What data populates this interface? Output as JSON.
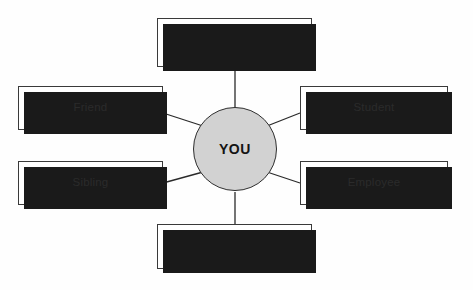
{
  "diagram": {
    "type": "radial-concept-map",
    "center": {
      "label": "YOU",
      "shape": "circle",
      "fill_color": "#d2d2d2",
      "border_color": "#2e2e2e",
      "cx": 235,
      "cy": 149,
      "r": 42
    },
    "style": {
      "background_color": "#fefefe",
      "box_fill_color": "#ffffff",
      "box_border_color": "#3a3a3a",
      "shadow_color": "#1a1a1a",
      "connector_color": "#2a2a2a",
      "text_color": "#2b2b2b"
    },
    "nodes": [
      {
        "id": "node-top",
        "label": "",
        "position": "top",
        "x": 157,
        "y": 18,
        "width": 155,
        "height": 49,
        "connector": {
          "x1": 235,
          "y1": 67,
          "x2": 235,
          "y2": 107
        }
      },
      {
        "id": "node-friend",
        "label": "Friend",
        "position": "left-upper",
        "x": 18,
        "y": 86,
        "width": 145,
        "height": 44,
        "connector": {
          "x1": 163,
          "y1": 113,
          "x2": 203,
          "y2": 126
        }
      },
      {
        "id": "node-student",
        "label": "Student",
        "position": "right-upper",
        "x": 300,
        "y": 86,
        "width": 148,
        "height": 44,
        "connector": {
          "x1": 300,
          "y1": 113,
          "x2": 267,
          "y2": 126
        }
      },
      {
        "id": "node-sibling",
        "label": "Sibling",
        "position": "left-lower",
        "x": 18,
        "y": 161,
        "width": 145,
        "height": 44,
        "connector": {
          "x1": 163,
          "y1": 183,
          "x2": 203,
          "y2": 172
        }
      },
      {
        "id": "node-employee",
        "label": "Employee",
        "position": "right-lower",
        "x": 300,
        "y": 161,
        "width": 148,
        "height": 44,
        "connector": {
          "x1": 300,
          "y1": 183,
          "x2": 267,
          "y2": 172
        }
      },
      {
        "id": "node-bottom",
        "label": "",
        "position": "bottom",
        "x": 157,
        "y": 224,
        "width": 155,
        "height": 45,
        "connector": {
          "x1": 235,
          "y1": 192,
          "x2": 235,
          "y2": 224
        }
      }
    ]
  }
}
